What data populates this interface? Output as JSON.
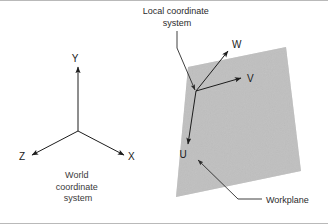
{
  "figure": {
    "background_color": "#ffffff",
    "width": 328,
    "height": 224
  },
  "world_coordinate_system": {
    "caption_line1": "World",
    "caption_line2": "coordinate",
    "caption_line3": "system",
    "origin": {
      "x": 78,
      "y": 131
    },
    "axes": [
      {
        "name": "y-axis",
        "label": "Y",
        "tip_x": 78,
        "tip_y": 67,
        "label_x": 75,
        "label_y": 62
      },
      {
        "name": "x-axis",
        "label": "X",
        "tip_x": 124,
        "tip_y": 155,
        "label_x": 128,
        "label_y": 160
      },
      {
        "name": "z-axis",
        "label": "Z",
        "tip_x": 32,
        "tip_y": 155,
        "label_x": 19,
        "label_y": 160
      }
    ]
  },
  "local_coordinate_system": {
    "annotation_line1": "Local coordinate",
    "annotation_line2": "system",
    "annotation_x": 177,
    "annotation_y1": 14,
    "annotation_y2": 26,
    "origin": {
      "x": 196,
      "y": 91
    },
    "leader": {
      "start_x": 177,
      "start_y": 31,
      "elbow_x": 177,
      "elbow_y": 48,
      "end_x": 195,
      "end_y": 90
    },
    "axes": [
      {
        "name": "w-axis",
        "label": "W",
        "tip_x": 228,
        "tip_y": 51,
        "label_x": 232,
        "label_y": 48
      },
      {
        "name": "v-axis",
        "label": "V",
        "tip_x": 241,
        "tip_y": 78,
        "label_x": 247,
        "label_y": 82
      },
      {
        "name": "u-axis",
        "label": "U",
        "tip_x": 188,
        "tip_y": 144,
        "label_x": 183,
        "label_y": 158
      }
    ]
  },
  "workplane": {
    "label": "Workplane",
    "label_x": 266,
    "label_y": 203,
    "fill_color": "#c3c3c3",
    "corners": [
      {
        "x": 188,
        "y": 67
      },
      {
        "x": 286,
        "y": 47
      },
      {
        "x": 301,
        "y": 171
      },
      {
        "x": 176,
        "y": 197
      }
    ],
    "leader": {
      "start_x": 262,
      "start_y": 199,
      "elbow_x": 238,
      "elbow_y": 199,
      "tip_x": 198,
      "tip_y": 160
    }
  },
  "colors": {
    "ink": "#1d1d1d",
    "plane_fill": "#c3c3c3",
    "rule": "#b9b9b9"
  }
}
